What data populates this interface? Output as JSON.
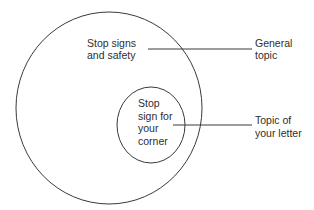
{
  "diagram": {
    "type": "nested-circles",
    "outer_circle": {
      "label_lines": [
        "Stop signs",
        "and safety"
      ]
    },
    "inner_circle": {
      "label_lines": [
        "Stop",
        "sign for",
        "your",
        "corner"
      ]
    },
    "callouts": [
      {
        "target": "outer_circle",
        "label_lines": [
          "General",
          "topic"
        ]
      },
      {
        "target": "inner_circle",
        "label_lines": [
          "Topic of",
          "your letter"
        ]
      }
    ],
    "colors": {
      "stroke": "#3a3a3a",
      "text": "#2e2e2e",
      "background": "#ffffff"
    }
  }
}
